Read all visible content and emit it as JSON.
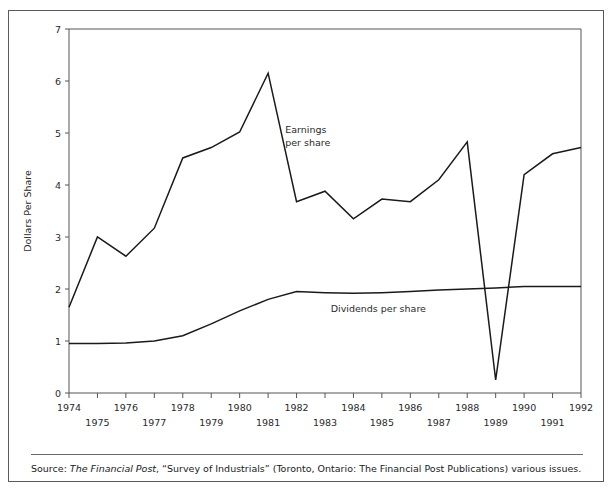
{
  "figure": {
    "source_prefix": "Source: ",
    "source_italic": "The Financial Post",
    "source_rest": ",  “Survey of Industrials” (Toronto, Ontario: The Financial Post Publications) various issues."
  },
  "labels": {
    "earnings_line1": "Earnings",
    "earnings_line2": "per share",
    "dividends": "Dividends per share",
    "y_axis_title": "Dollars Per Share",
    "x_axis_title": "Year"
  },
  "chart_data": {
    "type": "line",
    "title": "",
    "xlabel": "Year",
    "ylabel": "Dollars Per Share",
    "xlim": [
      1974,
      1992
    ],
    "ylim": [
      0,
      7
    ],
    "yticks": [
      0,
      1,
      2,
      3,
      4,
      5,
      6,
      7
    ],
    "ytick_labels": [
      "0",
      "1",
      "2",
      "3",
      "4",
      "5",
      "6",
      "7"
    ],
    "grid": false,
    "legend_position": "inline-annotation",
    "x": [
      1974,
      1975,
      1976,
      1977,
      1978,
      1979,
      1980,
      1981,
      1982,
      1983,
      1984,
      1985,
      1986,
      1987,
      1988,
      1989,
      1990,
      1991,
      1992
    ],
    "xtick_labels": [
      "1974",
      "1975",
      "1976",
      "1977",
      "1978",
      "1979",
      "1980",
      "1981",
      "1982",
      "1983",
      "1984",
      "1985",
      "1986",
      "1987",
      "1988",
      "1989",
      "1990",
      "1991",
      "1992"
    ],
    "xtick_labels_upper_row": [
      "1974",
      "1976",
      "1978",
      "1980",
      "1982",
      "1984",
      "1986",
      "1988",
      "1990",
      "1992"
    ],
    "xtick_labels_lower_row": [
      "1975",
      "1977",
      "1979",
      "1981",
      "1983",
      "1985",
      "1987",
      "1989",
      "1991"
    ],
    "series": [
      {
        "name": "Earnings per share",
        "color": "#1a1a1a",
        "values": [
          1.65,
          3.0,
          2.63,
          3.17,
          4.52,
          4.72,
          5.02,
          6.15,
          3.68,
          3.88,
          3.35,
          3.73,
          3.68,
          4.1,
          4.83,
          0.25,
          4.2,
          4.6,
          4.72
        ]
      },
      {
        "name": "Dividends per share",
        "color": "#1a1a1a",
        "values": [
          0.95,
          0.95,
          0.96,
          1.0,
          1.1,
          1.33,
          1.58,
          1.8,
          1.95,
          1.93,
          1.92,
          1.93,
          1.95,
          1.98,
          2.0,
          2.02,
          2.05,
          2.05,
          2.05
        ]
      }
    ],
    "annotations": [
      {
        "text": "Earnings per share",
        "x": 1981.6,
        "y": 5.0
      },
      {
        "text": "Dividends per share",
        "x": 1983.2,
        "y": 1.55
      }
    ]
  }
}
